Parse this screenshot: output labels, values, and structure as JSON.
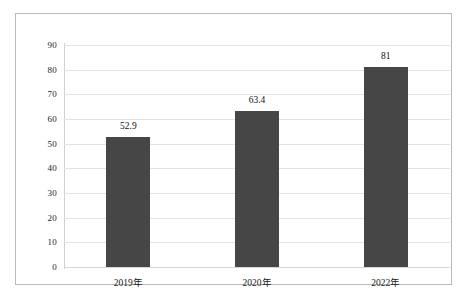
{
  "chart_data": {
    "type": "bar",
    "title": "",
    "subtitle": "",
    "xlabel": "",
    "ylabel": "",
    "categories": [
      "2019年",
      "2020年",
      "2022年"
    ],
    "values": [
      52.9,
      63.4,
      81
    ],
    "value_labels": [
      "52.9",
      "63.4",
      "81"
    ],
    "ylim": [
      0,
      90
    ],
    "ytick_labels": [
      "0",
      "10",
      "20",
      "30",
      "40",
      "50",
      "60",
      "70",
      "80",
      "90"
    ],
    "ytick_values": [
      0,
      10,
      20,
      30,
      40,
      50,
      60,
      70,
      80,
      90
    ],
    "grid": true,
    "legend": false,
    "legend_position": "none",
    "bar_color": "#464646",
    "gridline_color": "#e2e2e2",
    "frame_color": "#b9b9b9",
    "background_color": "#ffffff"
  }
}
